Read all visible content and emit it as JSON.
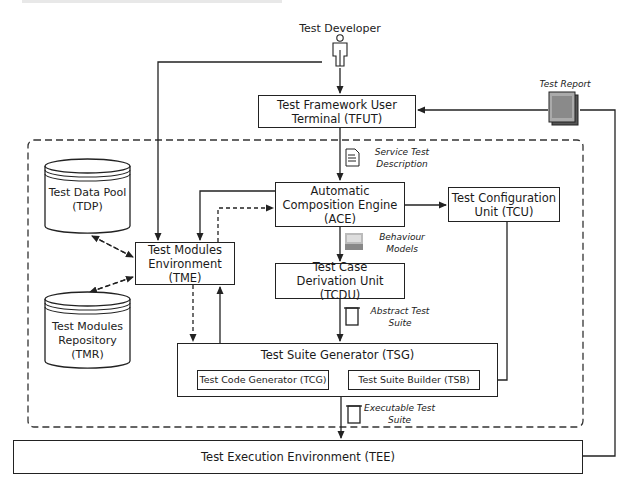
{
  "diagram": {
    "actor": {
      "label": "Test Developer",
      "icon": "person-icon"
    },
    "boxes": {
      "tfut": {
        "line1": "Test Framework User",
        "line2": "Terminal (TFUT)"
      },
      "ace": {
        "line1": "Automatic",
        "line2": "Composition Engine",
        "line3": "(ACE)"
      },
      "tcu": {
        "line1": "Test Configuration",
        "line2": "Unit (TCU)"
      },
      "tme": {
        "line1": "Test Modules",
        "line2": "Environment",
        "line3": "(TME)"
      },
      "tcdu": {
        "line1": "Test Case",
        "line2": "Derivation Unit (TCDU)"
      },
      "tsg": {
        "title": "Test Suite Generator (TSG)",
        "tcg": "Test Code Generator (TCG)",
        "tsb": "Test Suite Builder (TSB)"
      },
      "tee": {
        "label": "Test Execution Environment (TEE)"
      }
    },
    "stores": {
      "tdp": {
        "line1": "Test Data Pool",
        "line2": "(TDP)"
      },
      "tmr": {
        "line1": "Test Modules",
        "line2": "Repository",
        "line3": "(TMR)"
      }
    },
    "artifacts": {
      "test_report": {
        "label": "Test Report",
        "icon": "report-stack-icon"
      },
      "service_test_description": {
        "line1": "Service Test",
        "line2": "Description",
        "icon": "document-icon"
      },
      "behaviour_models": {
        "line1": "Behaviour",
        "line2": "Models",
        "icon": "model-image-icon"
      },
      "abstract_test_suite": {
        "line1": "Abstract Test",
        "line2": "Suite",
        "icon": "scroll-icon"
      },
      "executable_test_suite": {
        "line1": "Executable Test",
        "line2": "Suite",
        "icon": "scroll-icon"
      }
    },
    "colors": {
      "stroke": "#222222",
      "background": "#ffffff",
      "report_fill": "#9a9a9a"
    }
  }
}
